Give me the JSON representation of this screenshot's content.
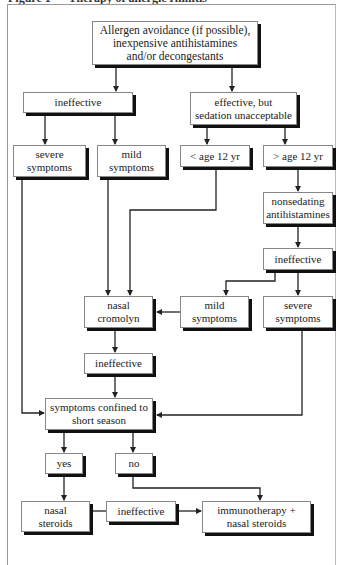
{
  "caption": "Figure 1 — Therapy of allergic rhinitis",
  "nodes": {
    "start": "Allergen avoidance (if possible),\ninexpensive antihistamines\nand/or decongestants",
    "ineffective_1": "ineffective",
    "effective_sedation": "effective, but\nsedation unacceptable",
    "severe_1": "severe\nsymptoms",
    "mild_1": "mild\nsymptoms",
    "age_under_12": "< age 12 yr",
    "age_over_12": "> age 12 yr",
    "nonsedating": "nonsedating\nantihistamines",
    "ineffective_2": "ineffective",
    "nasal_cromolyn": "nasal\ncromolyn",
    "mild_2": "mild\nsymptoms",
    "severe_2": "severe\nsymptoms",
    "ineffective_3": "ineffective",
    "short_season": "symptoms confined to\nshort season",
    "yes": "yes",
    "no": "no",
    "nasal_steroids": "nasal\nsteroids",
    "ineffective_4": "ineffective",
    "immunotherapy": "immunotherapy +\nnasal steroids"
  },
  "edges": [
    [
      "start",
      "ineffective_1"
    ],
    [
      "start",
      "effective_sedation"
    ],
    [
      "ineffective_1",
      "severe_1"
    ],
    [
      "ineffective_1",
      "mild_1"
    ],
    [
      "effective_sedation",
      "age_under_12"
    ],
    [
      "effective_sedation",
      "age_over_12"
    ],
    [
      "age_over_12",
      "nonsedating"
    ],
    [
      "nonsedating",
      "ineffective_2"
    ],
    [
      "ineffective_2",
      "mild_2"
    ],
    [
      "ineffective_2",
      "severe_2"
    ],
    [
      "mild_1",
      "nasal_cromolyn"
    ],
    [
      "age_under_12",
      "nasal_cromolyn"
    ],
    [
      "mild_2",
      "nasal_cromolyn"
    ],
    [
      "nasal_cromolyn",
      "ineffective_3"
    ],
    [
      "ineffective_3",
      "short_season"
    ],
    [
      "severe_1",
      "short_season"
    ],
    [
      "severe_2",
      "short_season"
    ],
    [
      "short_season",
      "yes"
    ],
    [
      "short_season",
      "no"
    ],
    [
      "yes",
      "nasal_steroids"
    ],
    [
      "no",
      "immunotherapy"
    ],
    [
      "nasal_steroids",
      "ineffective_4"
    ],
    [
      "ineffective_4",
      "immunotherapy"
    ]
  ]
}
